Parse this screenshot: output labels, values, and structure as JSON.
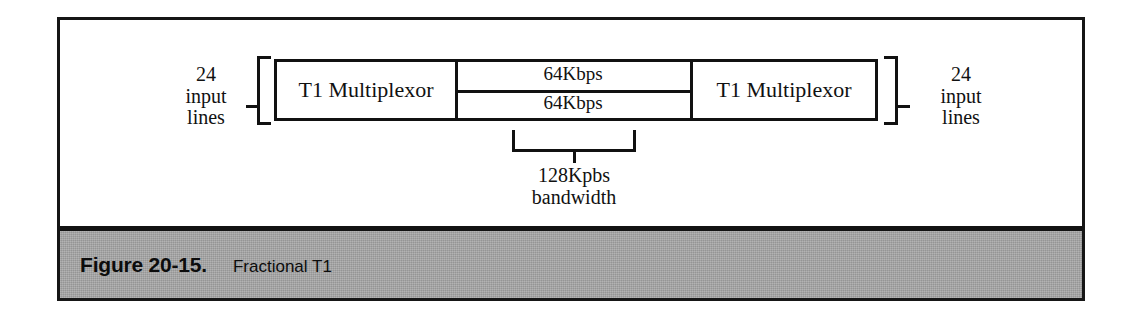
{
  "figure": {
    "caption_label": "Figure 20-15.",
    "caption_title": "Fractional T1",
    "frame_color": "#161616",
    "caption_bar_color": "#a3a3a3",
    "ink_color": "#111111",
    "paper_color": "#ffffff"
  },
  "diagram": {
    "type": "block-diagram",
    "left_endpoint": {
      "bracket": "[",
      "lines": [
        "24",
        "input",
        "lines"
      ],
      "count": 24
    },
    "right_endpoint": {
      "bracket": "]",
      "lines": [
        "24",
        "input",
        "lines"
      ],
      "count": 24
    },
    "nodes": [
      {
        "id": "mux-left",
        "label": "T1 Multiplexor"
      },
      {
        "id": "mux-right",
        "label": "T1 Multiplexor"
      }
    ],
    "links": [
      {
        "id": "channel-1",
        "label": "64Kbps",
        "rate_kbps": 64
      },
      {
        "id": "channel-2",
        "label": "64Kbps",
        "rate_kbps": 64
      }
    ],
    "bandwidth_bracket": {
      "lines": [
        "128Kpbs",
        "bandwidth"
      ],
      "value": "128Kpbs",
      "caption": "bandwidth",
      "total_kbps": 128
    }
  }
}
